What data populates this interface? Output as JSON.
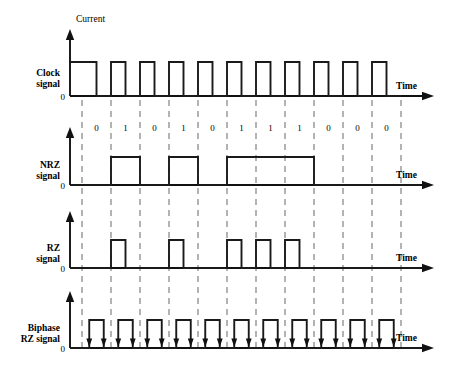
{
  "figure": {
    "title_axis_label": "Current",
    "time_label": "Time",
    "zero_label": "0"
  },
  "labels": {
    "clock_line1": "Clock",
    "clock_line2": "signal",
    "nrz_line1": "NRZ",
    "nrz_line2": "signal",
    "rz_line1": "RZ",
    "rz_line2": "signal",
    "biphase_line1": "Biphase",
    "biphase_line2": "RZ signal"
  },
  "colors": {
    "wave": "#1a1a1a",
    "axis": "#111111",
    "grid": "#9a9a9a",
    "background": "#ffffff"
  },
  "chart_data": {
    "type": "line",
    "xlabel": "Time",
    "ylabel": "Current",
    "grid": true,
    "legend": "none",
    "bits": [
      "0",
      "1",
      "0",
      "1",
      "0",
      "1",
      "1",
      "1",
      "0",
      "0",
      "0"
    ],
    "bit_count": 11,
    "series": [
      {
        "name": "Clock signal",
        "encoding": "clock",
        "description": "Square wave, starts high, one full cycle per bit, high during first half of each bit cell",
        "values": [
          1,
          1,
          1,
          1,
          1,
          1,
          1,
          1,
          1,
          1,
          1
        ]
      },
      {
        "name": "NRZ signal",
        "encoding": "nrz",
        "description": "High for whole bit cell when bit is 1, low when bit is 0",
        "values": [
          0,
          1,
          0,
          1,
          0,
          1,
          1,
          1,
          0,
          0,
          0
        ]
      },
      {
        "name": "RZ signal",
        "encoding": "rz",
        "description": "Pulse during first half of bit cell when bit is 1, returns to zero in second half",
        "values": [
          0,
          1,
          0,
          1,
          0,
          1,
          1,
          1,
          0,
          0,
          0
        ]
      },
      {
        "name": "Biphase RZ signal",
        "encoding": "biphase-rz",
        "description": "Pulse centred on every bit cell regardless of bit value, with transition arrows",
        "values": [
          1,
          1,
          1,
          1,
          1,
          1,
          1,
          1,
          1,
          1,
          1
        ]
      }
    ],
    "rows": [
      {
        "name": "Clock signal",
        "baseline_y": 96,
        "high_y": 62,
        "axis_top_y": 30
      },
      {
        "name": "NRZ signal",
        "baseline_y": 185,
        "high_y": 157,
        "axis_top_y": 128
      },
      {
        "name": "RZ signal",
        "baseline_y": 268,
        "high_y": 240,
        "axis_top_y": 212
      },
      {
        "name": "Biphase RZ signal",
        "baseline_y": 348,
        "high_y": 320,
        "axis_top_y": 292
      }
    ],
    "axis_x": 70,
    "bit_start_x": 82,
    "bit_width": 29,
    "axis_end_x": 432
  }
}
